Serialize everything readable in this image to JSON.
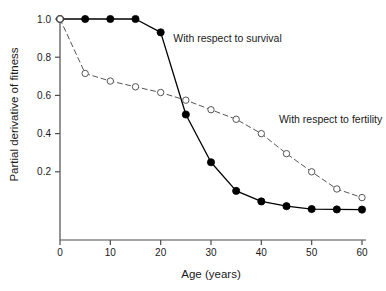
{
  "chart_data": {
    "type": "line",
    "title": "",
    "xlabel": "Age (years)",
    "ylabel": "Partial derivative of fitness",
    "xlim": [
      0,
      60
    ],
    "ylim": [
      0,
      1.0
    ],
    "xticks": [
      0,
      10,
      20,
      30,
      40,
      50,
      60
    ],
    "xticklabels": [
      "0",
      "10",
      "20",
      "30",
      "40",
      "50",
      "60"
    ],
    "yticks": [
      0.2,
      0.4,
      0.6,
      0.8,
      1.0
    ],
    "yticklabels": [
      "0.2",
      "0.4",
      "0.6",
      "0.8",
      "1.0"
    ],
    "grid": false,
    "legend": "annotations-inline",
    "x": [
      0,
      5,
      10,
      15,
      20,
      25,
      30,
      35,
      40,
      45,
      50,
      55,
      60
    ],
    "series": [
      {
        "name": "With respect to survival",
        "marker": "filled-circle",
        "linestyle": "solid",
        "color": "#000000",
        "x": [
          0,
          5,
          10,
          15,
          20,
          25,
          30,
          35,
          40,
          45,
          50,
          55,
          60
        ],
        "values": [
          1.0,
          1.0,
          1.0,
          1.0,
          0.93,
          0.5,
          0.25,
          0.1,
          0.045,
          0.02,
          0.005,
          0.003,
          0.002
        ]
      },
      {
        "name": "With respect to fertility",
        "marker": "open-circle",
        "linestyle": "dashed",
        "color": "#555555",
        "x": [
          0,
          5,
          10,
          15,
          20,
          25,
          30,
          35,
          40,
          45,
          50,
          55,
          60
        ],
        "values": [
          1.0,
          0.715,
          0.675,
          0.645,
          0.615,
          0.575,
          0.525,
          0.475,
          0.4,
          0.295,
          0.2,
          0.11,
          0.065
        ]
      }
    ],
    "annotations": [
      {
        "text": "With respect to survival",
        "x": 22.5,
        "y": 0.88
      },
      {
        "text": "With respect to fertility",
        "x": 43.5,
        "y": 0.455
      }
    ]
  },
  "axes_geometry": {
    "left": 60,
    "right": 362,
    "top": 19,
    "bottom": 210,
    "axis_foot": 240
  }
}
